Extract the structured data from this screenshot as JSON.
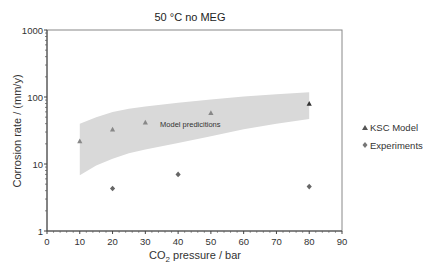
{
  "chart_data": {
    "type": "scatter",
    "title": "50 °C no MEG",
    "xlabel": "CO2 pressure / bar",
    "xlabel_main": "CO",
    "xlabel_sub": "2",
    "xlabel_rest": " pressure / bar",
    "ylabel": "Corrosion rate / (mm/y)",
    "xlim": [
      0,
      90
    ],
    "ylim": [
      1,
      1000
    ],
    "yscale": "log",
    "grid": false,
    "legend_position": "right",
    "x_ticks": [
      "0",
      "10",
      "20",
      "30",
      "40",
      "50",
      "60",
      "70",
      "80",
      "90"
    ],
    "y_ticks": [
      "1",
      "10",
      "100",
      "1000"
    ],
    "series": [
      {
        "name": "KSC Model",
        "marker": "triangle",
        "x": [
          10,
          20,
          30,
          50,
          80
        ],
        "y": [
          22,
          33,
          42,
          58,
          80
        ]
      },
      {
        "name": "Experiments",
        "marker": "diamond",
        "x": [
          20,
          40,
          80
        ],
        "y": [
          4.3,
          7,
          4.6
        ]
      }
    ],
    "band": {
      "label": "Model predicitions",
      "x": [
        10,
        15,
        20,
        25,
        30,
        40,
        50,
        60,
        70,
        80
      ],
      "upper": [
        40,
        50,
        60,
        67,
        72,
        82,
        92,
        102,
        110,
        118
      ],
      "lower": [
        6.8,
        9.5,
        12,
        14.5,
        16.5,
        20.5,
        26,
        33,
        40,
        47
      ]
    }
  }
}
